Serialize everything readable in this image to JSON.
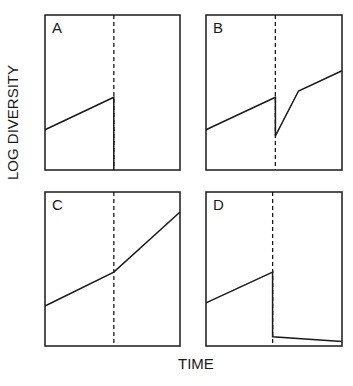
{
  "chart_data": {
    "type": "line",
    "title": "",
    "xlabel": "TIME",
    "ylabel": "LOG DIVERSITY",
    "grid": false,
    "legend": null,
    "panels": [
      {
        "label": "A",
        "event_x": 0.51,
        "points": [
          [
            0.0,
            0.26
          ],
          [
            0.51,
            0.47
          ],
          [
            0.51,
            0.0
          ]
        ],
        "description": "Diversity rises then drops to zero at event (extinction)"
      },
      {
        "label": "B",
        "event_x": 0.51,
        "points": [
          [
            0.0,
            0.26
          ],
          [
            0.51,
            0.47
          ],
          [
            0.51,
            0.22
          ],
          [
            0.68,
            0.51
          ],
          [
            1.0,
            0.64
          ]
        ],
        "description": "Diversity drops at event then recovers quickly"
      },
      {
        "label": "C",
        "event_x": 0.51,
        "points": [
          [
            0.0,
            0.26
          ],
          [
            0.51,
            0.48
          ],
          [
            1.0,
            0.87
          ]
        ],
        "description": "Diversification rate increases after event"
      },
      {
        "label": "D",
        "event_x": 0.49,
        "points": [
          [
            0.0,
            0.28
          ],
          [
            0.49,
            0.48
          ],
          [
            0.49,
            0.06
          ],
          [
            1.0,
            0.03
          ]
        ],
        "description": "Diversity drops at event and slowly declines"
      }
    ]
  },
  "labels": {
    "ylabel": "LOG DIVERSITY",
    "xlabel": "TIME",
    "panel_a": "A",
    "panel_b": "B",
    "panel_c": "C",
    "panel_d": "D"
  },
  "colors": {
    "line": "#1a1a1a",
    "background": "#ffffff"
  }
}
